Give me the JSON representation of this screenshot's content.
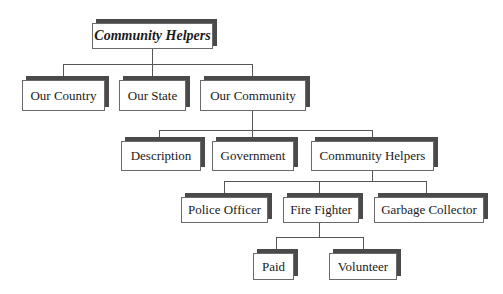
{
  "diagram": {
    "type": "org-chart-tree",
    "root": {
      "label": "Community Helpers"
    },
    "level1": [
      {
        "label": "Our Country"
      },
      {
        "label": "Our State"
      },
      {
        "label": "Our Community"
      }
    ],
    "level2": [
      {
        "label": "Description"
      },
      {
        "label": "Government"
      },
      {
        "label": "Community Helpers"
      }
    ],
    "level3": [
      {
        "label": "Police Officer"
      },
      {
        "label": "Fire Fighter"
      },
      {
        "label": "Garbage Collector"
      }
    ],
    "level4": [
      {
        "label": "Paid"
      },
      {
        "label": "Volunteer"
      }
    ],
    "edges": [
      [
        "Community Helpers",
        "Our Country"
      ],
      [
        "Community Helpers",
        "Our State"
      ],
      [
        "Community Helpers",
        "Our Community"
      ],
      [
        "Our Community",
        "Description"
      ],
      [
        "Our Community",
        "Government"
      ],
      [
        "Our Community",
        "Community Helpers"
      ],
      [
        "Community Helpers",
        "Police Officer"
      ],
      [
        "Community Helpers",
        "Fire Fighter"
      ],
      [
        "Community Helpers",
        "Garbage Collector"
      ],
      [
        "Fire Fighter",
        "Paid"
      ],
      [
        "Fire Fighter",
        "Volunteer"
      ]
    ],
    "colors": {
      "box_fill": "#ffffff",
      "box_border": "#6a6a6a",
      "shadow": "#4a4a4a",
      "connector": "#555555"
    }
  }
}
